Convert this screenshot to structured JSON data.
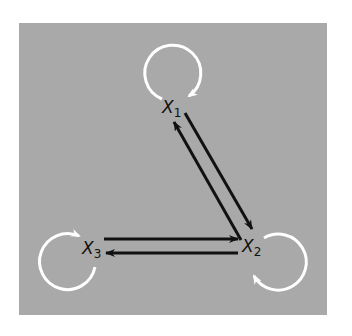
{
  "diagram": {
    "type": "directed-graph",
    "background_color": "#a9a9a9",
    "edge_color": "#111111",
    "self_loop_color": "#ffffff",
    "nodes": [
      {
        "id": "x1",
        "label": "X",
        "subscript": "1"
      },
      {
        "id": "x2",
        "label": "X",
        "subscript": "2"
      },
      {
        "id": "x3",
        "label": "X",
        "subscript": "3"
      }
    ],
    "edges": [
      {
        "from": "x1",
        "to": "x2"
      },
      {
        "from": "x2",
        "to": "x1"
      },
      {
        "from": "x3",
        "to": "x2"
      },
      {
        "from": "x2",
        "to": "x3"
      }
    ],
    "self_loops": [
      {
        "node": "x1",
        "direction": "clockwise"
      },
      {
        "node": "x2",
        "direction": "counterclockwise"
      },
      {
        "node": "x3",
        "direction": "clockwise"
      }
    ]
  }
}
